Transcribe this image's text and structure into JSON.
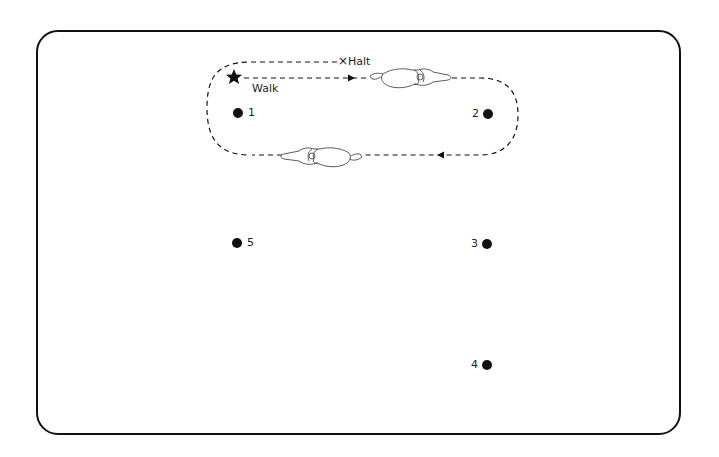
{
  "diagram": {
    "type": "riding-pattern",
    "labels": {
      "start": "Walk",
      "halt": "Halt",
      "halt_marker": "×"
    },
    "markers": [
      {
        "id": "1",
        "label": "1",
        "x": 238,
        "y": 113,
        "label_side": "right"
      },
      {
        "id": "2",
        "label": "2",
        "x": 488,
        "y": 114,
        "label_side": "left"
      },
      {
        "id": "3",
        "label": "3",
        "x": 487,
        "y": 244,
        "label_side": "left"
      },
      {
        "id": "4",
        "label": "4",
        "x": 487,
        "y": 365,
        "label_side": "left"
      },
      {
        "id": "5",
        "label": "5",
        "x": 237,
        "y": 243,
        "label_side": "right"
      }
    ],
    "start_icon": "star-icon",
    "horse_icons": [
      "horse-facing-right-icon",
      "horse-facing-left-icon"
    ],
    "colors": {
      "line": "#111111",
      "background": "#ffffff"
    }
  }
}
